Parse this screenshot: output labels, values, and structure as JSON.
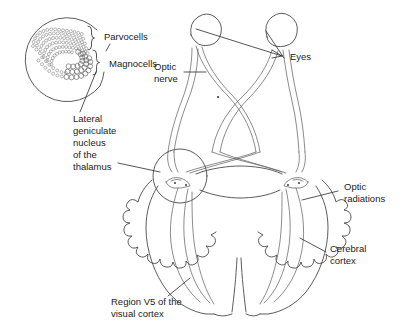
{
  "figure": {
    "background_color": "#ffffff",
    "line_color": "#4a4a4a",
    "text_color": "#1c1c1c"
  },
  "labels": {
    "parvocells": "Parvocells",
    "magnocells": "Magnocells",
    "lgn_line1": "Lateral",
    "lgn_line2": "geniculate",
    "lgn_line3": "nucleus",
    "lgn_line4": "of the",
    "lgn_line5": "thalamus",
    "optic_nerve_line1": "Optic",
    "optic_nerve_line2": "nerve",
    "eyes": "Eyes",
    "optic_radiations_line1": "Optic",
    "optic_radiations_line2": "radiations",
    "cerebral_cortex_line1": "Cerebral",
    "cerebral_cortex_line2": "cortex",
    "region_v5_line1": "Region V5 of the",
    "region_v5_line2": "visual cortex"
  },
  "structures": {
    "inset_label": "magnified lateral geniculate nucleus inset",
    "eye_left": "left eye globe",
    "eye_right": "right eye globe",
    "optic_chiasm": "optic chiasm crossing",
    "lgn_highlight": "lateral geniculate nucleus highlight circle",
    "cortex": "cerebral cortex gyrified outline"
  }
}
